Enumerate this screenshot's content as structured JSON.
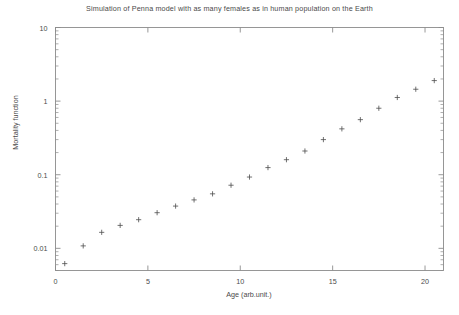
{
  "chart_data": {
    "type": "scatter",
    "title": "Simulation of Penna model with as many females as in human population on the Earth",
    "xlabel": "Age (arb.unit.)",
    "ylabel": "Mortality function",
    "xlim": [
      0,
      21
    ],
    "ylim": [
      0.005,
      10
    ],
    "yscale": "log",
    "xscale": "linear",
    "grid": false,
    "legend": null,
    "marker": "plus",
    "marker_color": "#4d4d4d",
    "xticks": [
      0,
      5,
      10,
      15,
      20
    ],
    "xtick_labels": [
      "0",
      "5",
      "10",
      "15",
      "20"
    ],
    "yticks": [
      0.01,
      0.1,
      1,
      10
    ],
    "ytick_labels": [
      "0.01",
      "0.1",
      "1",
      "10"
    ],
    "x": [
      0.5,
      1.5,
      2.5,
      3.5,
      4.5,
      5.5,
      6.5,
      7.5,
      8.5,
      9.5,
      10.5,
      11.5,
      12.5,
      13.5,
      14.5,
      15.5,
      16.5,
      17.5,
      18.5,
      19.5,
      20.5
    ],
    "y": [
      0.0062,
      0.0108,
      0.0165,
      0.0205,
      0.0245,
      0.0305,
      0.0375,
      0.0455,
      0.055,
      0.072,
      0.093,
      0.125,
      0.16,
      0.21,
      0.3,
      0.42,
      0.56,
      0.8,
      1.12,
      1.45,
      1.9
    ],
    "series_note": "single series of plus markers rising monotonically on a log y-axis"
  },
  "axes": {
    "background": "#ffffff",
    "frame_color": "#8c8c8c",
    "tick_color": "#8c8c8c"
  }
}
